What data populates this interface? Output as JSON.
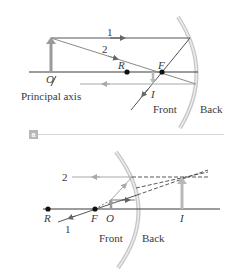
{
  "figure": {
    "panel_a": {
      "tag": "a",
      "labels": {
        "ray1": "1",
        "ray2": "2",
        "object": "O",
        "center": "R",
        "focal": "F",
        "image": "I",
        "axis": "Principal axis",
        "front": "Front",
        "back": "Back"
      }
    },
    "panel_b": {
      "labels": {
        "ray1": "1",
        "ray2": "2",
        "center": "R",
        "focal": "F",
        "object": "O",
        "image": "I",
        "front": "Front",
        "back": "Back"
      }
    },
    "colors": {
      "axis": "#3a3a3a",
      "ray": "#555555",
      "ray_light": "#9a9a9a",
      "mirror_outer": "#c8c8c8",
      "mirror_inner": "#e8e8e8",
      "object_arrow": "#9a9a9a",
      "dot": "#111111"
    }
  }
}
